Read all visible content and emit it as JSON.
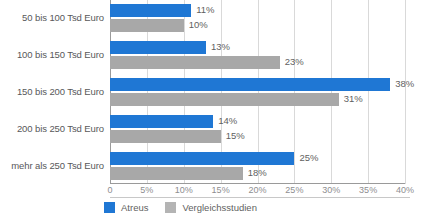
{
  "chart_data": {
    "type": "bar",
    "orientation": "horizontal",
    "title": "",
    "xlabel": "",
    "ylabel": "",
    "xlim": [
      0,
      40
    ],
    "grid": true,
    "legend_position": "bottom-left",
    "value_suffix": "%",
    "categories": [
      "50 bis 100 Tsd Euro",
      "100 bis 150 Tsd Euro",
      "150 bis 200 Tsd Euro",
      "200 bis 250 Tsd Euro",
      "mehr als 250 Tsd Euro"
    ],
    "tick_labels": [
      "0",
      "5%",
      "10%",
      "15%",
      "20%",
      "25%",
      "30%",
      "35%",
      "40%"
    ],
    "tick_values": [
      0,
      5,
      10,
      15,
      20,
      25,
      30,
      35,
      40
    ],
    "series": [
      {
        "name": "Atreus",
        "color": "#1f77d4",
        "values": [
          11,
          13,
          38,
          14,
          25
        ],
        "value_labels": [
          "11%",
          "13%",
          "38%",
          "14%",
          "25%"
        ]
      },
      {
        "name": "Vergleichsstudien",
        "color": "#a8a8a8",
        "values": [
          10,
          23,
          31,
          15,
          18
        ],
        "value_labels": [
          "10%",
          "23%",
          "31%",
          "15%",
          "18%"
        ]
      }
    ]
  },
  "legend": {
    "items": [
      {
        "label": "Atreus"
      },
      {
        "label": "Vergleichsstudien"
      }
    ]
  }
}
